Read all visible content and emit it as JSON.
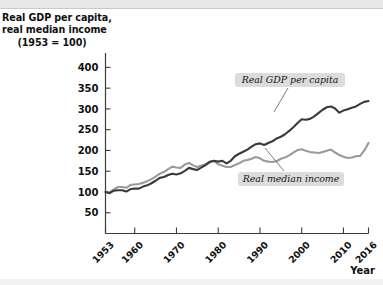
{
  "chart_data": {
    "type": "line",
    "title": "Real GDP per capita, real median income (1953 = 100)",
    "title_lines": [
      "Real GDP per capita,",
      "real median income",
      "(1953 = 100)"
    ],
    "xlabel": "Year",
    "ylabel": "",
    "xlim": [
      1953,
      2016
    ],
    "ylim": [
      0,
      425
    ],
    "grid": false,
    "legend_position": "inline-annotations",
    "yticks": [
      50,
      100,
      150,
      200,
      250,
      300,
      350,
      400
    ],
    "ytick_labels": [
      "50",
      "100",
      "150",
      "200",
      "250",
      "300",
      "350",
      "400"
    ],
    "xticks": [
      1953,
      1960,
      1970,
      1980,
      1990,
      2000,
      2010,
      2016
    ],
    "xtick_labels": [
      "1953",
      "1960",
      "1970",
      "1980",
      "1990",
      "2000",
      "2010",
      "2016"
    ],
    "annotations": [
      {
        "text": "Real GDP per capita",
        "series": "Real GDP per capita"
      },
      {
        "text": "Real median income",
        "series": "Real median income"
      }
    ],
    "x": [
      1953,
      1954,
      1955,
      1956,
      1957,
      1958,
      1959,
      1960,
      1961,
      1962,
      1963,
      1964,
      1965,
      1966,
      1967,
      1968,
      1969,
      1970,
      1971,
      1972,
      1973,
      1974,
      1975,
      1976,
      1977,
      1978,
      1979,
      1980,
      1981,
      1982,
      1983,
      1984,
      1985,
      1986,
      1987,
      1988,
      1989,
      1990,
      1991,
      1992,
      1993,
      1994,
      1995,
      1996,
      1997,
      1998,
      1999,
      2000,
      2001,
      2002,
      2003,
      2004,
      2005,
      2006,
      2007,
      2008,
      2009,
      2010,
      2011,
      2012,
      2013,
      2014,
      2015,
      2016
    ],
    "series": [
      {
        "name": "Real GDP per capita",
        "color": "#3a3a3a",
        "values": [
          100,
          97,
          103,
          104,
          104,
          101,
          107,
          108,
          108,
          113,
          116,
          121,
          127,
          134,
          136,
          141,
          144,
          142,
          145,
          151,
          158,
          155,
          153,
          159,
          165,
          172,
          175,
          173,
          175,
          169,
          175,
          186,
          192,
          197,
          202,
          209,
          215,
          217,
          213,
          218,
          222,
          229,
          233,
          239,
          247,
          256,
          266,
          275,
          274,
          276,
          282,
          290,
          298,
          304,
          306,
          301,
          291,
          296,
          299,
          303,
          306,
          312,
          317,
          319
        ]
      },
      {
        "name": "Real median income",
        "color": "#9a9a9a",
        "values": [
          100,
          99,
          106,
          112,
          112,
          110,
          117,
          118,
          119,
          122,
          126,
          131,
          137,
          144,
          148,
          155,
          161,
          159,
          158,
          166,
          170,
          164,
          160,
          164,
          167,
          174,
          174,
          167,
          163,
          160,
          160,
          165,
          169,
          175,
          177,
          180,
          184,
          181,
          175,
          173,
          172,
          174,
          180,
          183,
          188,
          195,
          201,
          203,
          199,
          196,
          195,
          194,
          196,
          199,
          202,
          195,
          189,
          185,
          182,
          183,
          186,
          187,
          200,
          218
        ]
      }
    ]
  },
  "callouts": {
    "gdp": {
      "label": "Real GDP per capita",
      "box": {
        "x": 235,
        "y": 73,
        "w": 110,
        "h": 14,
        "rx": 3
      },
      "text_x": 290,
      "text_y": 83,
      "leader": "M 288 88 L 274 112"
    },
    "income": {
      "label": "Real median income",
      "box": {
        "x": 238,
        "y": 172,
        "w": 106,
        "h": 14,
        "rx": 3
      },
      "text_x": 291,
      "text_y": 182,
      "leader": "M 284 171 L 265 148"
    }
  },
  "axis_name": {
    "label": "Year",
    "x": 375,
    "y": 274
  }
}
